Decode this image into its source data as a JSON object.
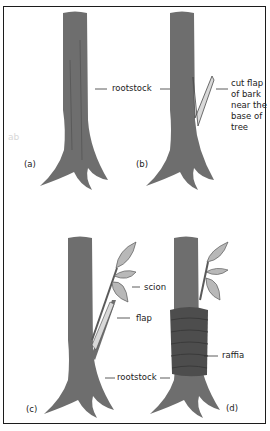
{
  "diagram": {
    "colors": {
      "bark": "#6e6e6e",
      "bark_dark": "#4a4a4a",
      "flap": "#d9d9d9",
      "leaf": "#b8b8b8",
      "raffia": "#4d4d4d",
      "border": "#1c1c1c",
      "text": "#222222"
    },
    "panels": [
      {
        "id": "a",
        "label": "(a)"
      },
      {
        "id": "b",
        "label": "(b)"
      },
      {
        "id": "c",
        "label": "(c)"
      },
      {
        "id": "d",
        "label": "(d)"
      }
    ],
    "callouts": {
      "rootstock_top": "rootstock",
      "cut_flap": "cut flap of bark near the base of tree",
      "scion": "scion",
      "flap": "flap",
      "rootstock_bottom": "rootstock",
      "raffia": "raffia"
    },
    "watermark": "ab"
  }
}
